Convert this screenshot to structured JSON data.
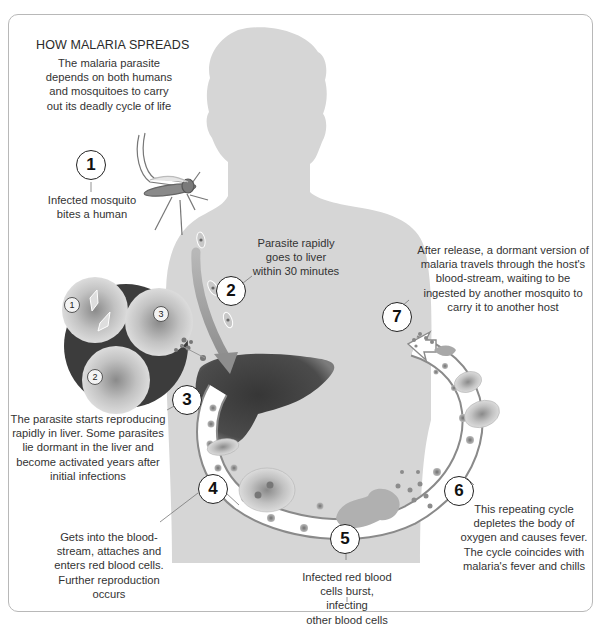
{
  "header": {
    "title": "HOW MALARIA SPREADS",
    "intro_lines": [
      "The malaria parasite",
      "depends on both humans",
      "and mosquitoes to carry",
      "out its deadly cycle of life"
    ]
  },
  "steps": [
    {
      "number": "1",
      "lines": [
        "Infected mosquito",
        "bites a human"
      ]
    },
    {
      "number": "2",
      "lines": [
        "Parasite rapidly",
        "goes to liver",
        "within 30 minutes"
      ]
    },
    {
      "number": "3",
      "lines": [
        "The parasite starts reproducing",
        "rapidly in liver.  Some parasites",
        "lie dormant in the liver and",
        "become activated years after",
        "initial infections"
      ]
    },
    {
      "number": "4",
      "lines": [
        "Gets into the blood-",
        "stream, attaches and",
        "enters red blood cells.",
        "Further reproduction",
        "occurs"
      ]
    },
    {
      "number": "5",
      "lines": [
        "Infected red blood",
        "cells burst, infecting",
        "other blood cells"
      ]
    },
    {
      "number": "6",
      "lines": [
        "This repeating cycle",
        "depletes the body of",
        "oxygen and causes fever.",
        "The cycle coincides with",
        "malaria's fever and chills"
      ]
    },
    {
      "number": "7",
      "lines": [
        "After release, a dormant version of",
        "malaria travels through the host's",
        "blood-stream, waiting to be",
        "ingested by another mosquito to",
        "carry it to another host"
      ]
    }
  ],
  "inset": {
    "labels": [
      "1",
      "2",
      "3"
    ]
  },
  "icons": {
    "human": "human-silhouette",
    "mosquito": "mosquito",
    "liver": "liver",
    "cycle": "bloodstream-cycle-arrow",
    "magnifier": "cell-magnifier-inset"
  },
  "colors": {
    "silhouette": "#d6d6d6",
    "liver": "#3a3a3a",
    "vessel_outline": "#8a8a8a",
    "cell": "#8f8f8f",
    "inset_bg": "#3c3c3c",
    "frame": "#b8b8b8"
  }
}
